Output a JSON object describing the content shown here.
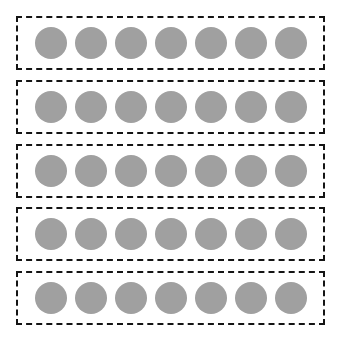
{
  "diagram": {
    "type": "grouped-counters",
    "group_count": 5,
    "counters_per_group": 7,
    "total_counters": 35,
    "canvas": {
      "width": 341,
      "height": 343,
      "background_color": "#ffffff"
    },
    "style": {
      "group_border_color": "#141414",
      "group_border_style": "dashed",
      "group_border_width": 2,
      "group_fill_color": "#ffffff",
      "counter_color": "#a0a0a0",
      "counter_shape": "circle",
      "counter_diameter": 32
    },
    "groups": [
      {
        "index": 1,
        "label": "Group 1",
        "count": 7,
        "counters": [
          {
            "label": "counter",
            "color": "#a0a0a0"
          },
          {
            "label": "counter",
            "color": "#a0a0a0"
          },
          {
            "label": "counter",
            "color": "#a0a0a0"
          },
          {
            "label": "counter",
            "color": "#a0a0a0"
          },
          {
            "label": "counter",
            "color": "#a0a0a0"
          },
          {
            "label": "counter",
            "color": "#a0a0a0"
          },
          {
            "label": "counter",
            "color": "#a0a0a0"
          }
        ]
      },
      {
        "index": 2,
        "label": "Group 2",
        "count": 7,
        "counters": [
          {
            "label": "counter",
            "color": "#a0a0a0"
          },
          {
            "label": "counter",
            "color": "#a0a0a0"
          },
          {
            "label": "counter",
            "color": "#a0a0a0"
          },
          {
            "label": "counter",
            "color": "#a0a0a0"
          },
          {
            "label": "counter",
            "color": "#a0a0a0"
          },
          {
            "label": "counter",
            "color": "#a0a0a0"
          },
          {
            "label": "counter",
            "color": "#a0a0a0"
          }
        ]
      },
      {
        "index": 3,
        "label": "Group 3",
        "count": 7,
        "counters": [
          {
            "label": "counter",
            "color": "#a0a0a0"
          },
          {
            "label": "counter",
            "color": "#a0a0a0"
          },
          {
            "label": "counter",
            "color": "#a0a0a0"
          },
          {
            "label": "counter",
            "color": "#a0a0a0"
          },
          {
            "label": "counter",
            "color": "#a0a0a0"
          },
          {
            "label": "counter",
            "color": "#a0a0a0"
          },
          {
            "label": "counter",
            "color": "#a0a0a0"
          }
        ]
      },
      {
        "index": 4,
        "label": "Group 4",
        "count": 7,
        "counters": [
          {
            "label": "counter",
            "color": "#a0a0a0"
          },
          {
            "label": "counter",
            "color": "#a0a0a0"
          },
          {
            "label": "counter",
            "color": "#a0a0a0"
          },
          {
            "label": "counter",
            "color": "#a0a0a0"
          },
          {
            "label": "counter",
            "color": "#a0a0a0"
          },
          {
            "label": "counter",
            "color": "#a0a0a0"
          },
          {
            "label": "counter",
            "color": "#a0a0a0"
          }
        ]
      },
      {
        "index": 5,
        "label": "Group 5",
        "count": 7,
        "counters": [
          {
            "label": "counter",
            "color": "#a0a0a0"
          },
          {
            "label": "counter",
            "color": "#a0a0a0"
          },
          {
            "label": "counter",
            "color": "#a0a0a0"
          },
          {
            "label": "counter",
            "color": "#a0a0a0"
          },
          {
            "label": "counter",
            "color": "#a0a0a0"
          },
          {
            "label": "counter",
            "color": "#a0a0a0"
          },
          {
            "label": "counter",
            "color": "#a0a0a0"
          }
        ]
      }
    ]
  }
}
